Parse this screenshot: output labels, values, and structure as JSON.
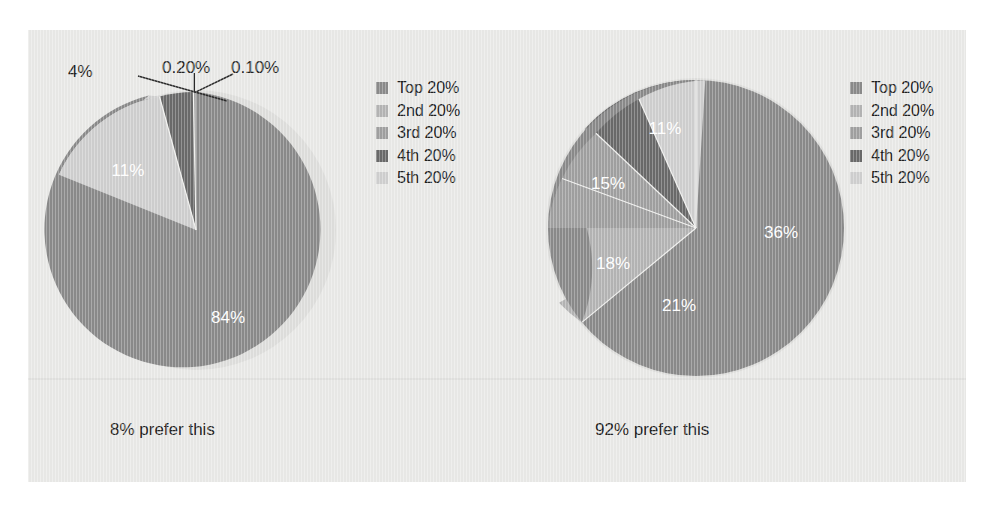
{
  "page": {
    "background_color": "#e9e9e7",
    "outer_background_color": "#ffffff"
  },
  "palette": {
    "top20": "#8a8a8a",
    "2nd20": "#b4b4b4",
    "3rd20": "#a0a0a0",
    "4th20": "#6a6a6a",
    "5th20": "#cfcfcf",
    "label_light": "#ffffff",
    "label_dark": "#232323",
    "separator": "#f2f2f0",
    "leader_line": "#2a2a2a"
  },
  "legend": {
    "items": [
      {
        "label": "Top 20%",
        "color": "#8a8a8a"
      },
      {
        "label": "2nd 20%",
        "color": "#b4b4b4"
      },
      {
        "label": "3rd 20%",
        "color": "#a0a0a0"
      },
      {
        "label": "4th 20%",
        "color": "#6a6a6a"
      },
      {
        "label": "5th 20%",
        "color": "#cfcfcf"
      }
    ]
  },
  "left": {
    "caption": "8% prefer this",
    "labels": {
      "s1": "84%",
      "s2": "0.10%",
      "s3": "0.20%",
      "s4": "4%",
      "s5": "11%"
    }
  },
  "right": {
    "caption": "92% prefer this",
    "labels": {
      "s1": "36%",
      "s2": "21%",
      "s3": "18%",
      "s4": "15%",
      "s5": "11%"
    }
  },
  "chart_data": [
    {
      "type": "pie",
      "title": "8% prefer this",
      "labels": [
        "Top 20%",
        "2nd 20%",
        "3rd 20%",
        "4th 20%",
        "5th 20%"
      ],
      "values": [
        84,
        0.1,
        0.2,
        4,
        11
      ],
      "display_labels": [
        "84%",
        "0.10%",
        "0.20%",
        "4%",
        "11%"
      ],
      "colors": [
        "#8a8a8a",
        "#b4b4b4",
        "#a0a0a0",
        "#6a6a6a",
        "#cfcfcf"
      ],
      "start_angle_deg": 0,
      "direction": "clockwise",
      "legend_position": "right",
      "grid": false
    },
    {
      "type": "pie",
      "title": "92% prefer this",
      "labels": [
        "Top 20%",
        "2nd 20%",
        "3rd 20%",
        "4th 20%",
        "5th 20%"
      ],
      "values": [
        36,
        21,
        18,
        15,
        11
      ],
      "display_labels": [
        "36%",
        "21%",
        "18%",
        "15%",
        "11%"
      ],
      "colors": [
        "#8a8a8a",
        "#b4b4b4",
        "#a0a0a0",
        "#6a6a6a",
        "#cfcfcf"
      ],
      "start_angle_deg": 0,
      "direction": "clockwise",
      "legend_position": "right",
      "grid": false
    }
  ]
}
